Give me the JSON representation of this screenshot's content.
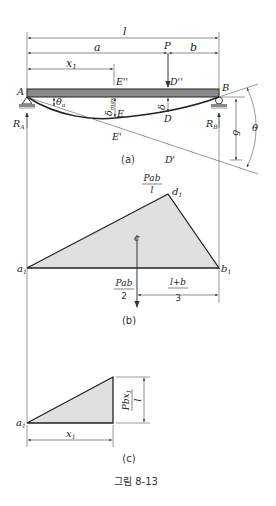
{
  "figure": {
    "caption": "그림 8-13",
    "colors": {
      "beam": "#8a8a8a",
      "fill": "#e0e0e0",
      "stroke": "#222222",
      "support": "#888888"
    }
  },
  "panel_a": {
    "sublabel": "(a)",
    "dims": {
      "l": "l",
      "a": "a",
      "b": "b",
      "x1": "x",
      "x1_sub": "1"
    },
    "load": "P",
    "points": {
      "A": "A",
      "B": "B",
      "E2": "E''",
      "D2": "D''",
      "E": "E",
      "D": "D",
      "E1": "E'",
      "D1": "D'"
    },
    "reactions": {
      "RA": "R",
      "RA_sub": "A",
      "RB": "R",
      "RB_sub": "B"
    },
    "angles": {
      "theta_a": "θ",
      "theta_a_sub": "a",
      "theta": "θ"
    },
    "deflections": {
      "delta_max": "δ",
      "delta_max_sub": "max",
      "delta": "δ",
      "delta_total": "δ"
    }
  },
  "panel_b": {
    "sublabel": "(b)",
    "points": {
      "a1": "a",
      "b1": "b",
      "d1": "d",
      "sub": "1",
      "c": "c"
    },
    "peak_label": {
      "num": "Pab",
      "den": "l"
    },
    "resultant_label": {
      "num": "Pab",
      "den": "2"
    },
    "distance_label": {
      "num": "l+b",
      "den": "3"
    }
  },
  "panel_c": {
    "sublabel": "(c)",
    "points": {
      "a1": "a",
      "sub": "1"
    },
    "height_label": {
      "num": "Pbx",
      "num_sub": "1",
      "den": "l"
    },
    "base_label": "x",
    "base_sub": "1"
  }
}
